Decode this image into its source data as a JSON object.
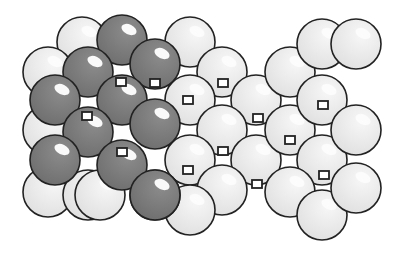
{
  "diagram": {
    "colors": {
      "background": "#ffffff",
      "light_sphere": "#e6e6e6",
      "dark_sphere": "#7a7a7a",
      "outline": "#222222",
      "hole": "#ffffff",
      "highlight": "#ffffff"
    },
    "sphere_radius": 25,
    "dark_spheres": [
      [
        122,
        40
      ],
      [
        155,
        64
      ],
      [
        88,
        72
      ],
      [
        122,
        100
      ],
      [
        155,
        124
      ],
      [
        55,
        100
      ],
      [
        88,
        132
      ],
      [
        55,
        160
      ],
      [
        122,
        165
      ],
      [
        155,
        195
      ]
    ],
    "light_spheres_back": [
      [
        82,
        42
      ],
      [
        48,
        72
      ],
      [
        48,
        130
      ],
      [
        48,
        192
      ],
      [
        88,
        195
      ],
      [
        100,
        195
      ]
    ],
    "light_spheres": [
      [
        190,
        42
      ],
      [
        222,
        72
      ],
      [
        190,
        100
      ],
      [
        256,
        100
      ],
      [
        222,
        130
      ],
      [
        190,
        160
      ],
      [
        256,
        160
      ],
      [
        222,
        190
      ],
      [
        190,
        210
      ],
      [
        290,
        72
      ],
      [
        322,
        44
      ],
      [
        290,
        130
      ],
      [
        322,
        100
      ],
      [
        322,
        160
      ],
      [
        290,
        192
      ],
      [
        356,
        44
      ],
      [
        356,
        130
      ],
      [
        322,
        215
      ],
      [
        356,
        188
      ],
      [
        155,
        195
      ]
    ],
    "holes": [
      [
        121,
        82
      ],
      [
        87,
        116
      ],
      [
        122,
        152
      ],
      [
        188,
        100
      ],
      [
        223,
        83
      ],
      [
        258,
        118
      ],
      [
        223,
        151
      ],
      [
        257,
        184
      ],
      [
        290,
        140
      ],
      [
        323,
        105
      ],
      [
        324,
        175
      ],
      [
        188,
        170
      ],
      [
        155,
        83
      ]
    ]
  }
}
